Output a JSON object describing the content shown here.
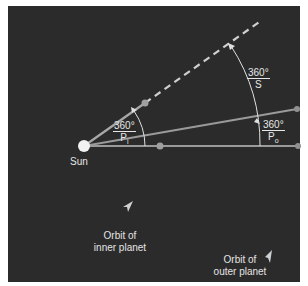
{
  "diagram": {
    "sun_label": "Sun",
    "angles": {
      "inner": {
        "numerator": "360°",
        "denominator": "P",
        "subscript": "i"
      },
      "synodic": {
        "numerator": "360°",
        "denominator": "S"
      },
      "outer": {
        "numerator": "360°",
        "denominator": "P",
        "subscript": "o"
      }
    },
    "orbit_labels": {
      "inner": [
        "Orbit of",
        "inner planet"
      ],
      "outer": [
        "Orbit of",
        "outer planet"
      ]
    },
    "colors": {
      "background": "#2b2b2b",
      "line": "#9a9a9a",
      "dashed": "#cfcfcf",
      "sun": "#f2f2f2",
      "planet": "#a0a0a0",
      "text": "#e4e4e4"
    }
  }
}
